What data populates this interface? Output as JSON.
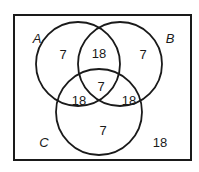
{
  "diagram": {
    "type": "venn",
    "sets": [
      {
        "id": "A",
        "label": "A"
      },
      {
        "id": "B",
        "label": "B"
      },
      {
        "id": "C",
        "label": "C"
      }
    ],
    "regions": {
      "A_only": "7",
      "B_only": "7",
      "C_only": "7",
      "AB_only": "18",
      "AC_only": "18",
      "BC_only": "18",
      "ABC": "7",
      "outside": "18"
    },
    "colors": {
      "stroke": "#1a1a1a",
      "background": "#ffffff"
    }
  }
}
